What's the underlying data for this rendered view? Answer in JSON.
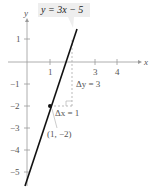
{
  "figure": {
    "equation_label": "y = 3x − 5",
    "x_axis_label": "x",
    "y_axis_label": "y",
    "x_ticks": [
      {
        "value": 1,
        "label": "1"
      },
      {
        "value": 3,
        "label": "3"
      },
      {
        "value": 4,
        "label": "4"
      }
    ],
    "y_ticks": [
      {
        "value": 1,
        "label": "1"
      },
      {
        "value": -1,
        "label": "−1"
      },
      {
        "value": -2,
        "label": "−2"
      },
      {
        "value": -3,
        "label": "−3"
      },
      {
        "value": -4,
        "label": "−4"
      },
      {
        "value": -5,
        "label": "−5"
      }
    ],
    "point_label": "(1, −2)",
    "delta_y_label": "Δy = 3",
    "delta_x_label": "Δx = 1",
    "line": {
      "slope": 3,
      "intercept": -5
    },
    "point": {
      "x": 1,
      "y": -2
    },
    "colors": {
      "line": "#111111",
      "axis": "#888888",
      "dashed": "#aaaaaa",
      "label_bg": "#eeeeee"
    }
  }
}
